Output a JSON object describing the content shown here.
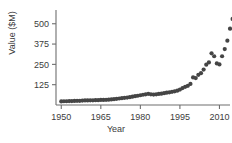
{
  "chart_data": {
    "type": "scatter",
    "title": "",
    "xlabel": "Year",
    "ylabel": "Value ($M)",
    "xlim": [
      1948,
      2014
    ],
    "ylim": [
      0,
      560
    ],
    "xticks": [
      1950,
      1965,
      1980,
      1995,
      2010
    ],
    "yticks": [
      125,
      250,
      375,
      500
    ],
    "grid": false,
    "legend": null,
    "marker": {
      "shape": "circle",
      "color": "#454545",
      "size": 2.1
    },
    "axis_color": "#6e6e6e",
    "points": [
      {
        "x": 1950,
        "y": 22
      },
      {
        "x": 1951,
        "y": 23
      },
      {
        "x": 1952,
        "y": 23
      },
      {
        "x": 1953,
        "y": 24
      },
      {
        "x": 1954,
        "y": 24
      },
      {
        "x": 1955,
        "y": 25
      },
      {
        "x": 1956,
        "y": 26
      },
      {
        "x": 1957,
        "y": 26
      },
      {
        "x": 1958,
        "y": 27
      },
      {
        "x": 1959,
        "y": 28
      },
      {
        "x": 1960,
        "y": 28
      },
      {
        "x": 1961,
        "y": 29
      },
      {
        "x": 1962,
        "y": 29
      },
      {
        "x": 1963,
        "y": 30
      },
      {
        "x": 1964,
        "y": 30
      },
      {
        "x": 1965,
        "y": 31
      },
      {
        "x": 1966,
        "y": 31
      },
      {
        "x": 1967,
        "y": 32
      },
      {
        "x": 1968,
        "y": 33
      },
      {
        "x": 1969,
        "y": 34
      },
      {
        "x": 1970,
        "y": 36
      },
      {
        "x": 1971,
        "y": 38
      },
      {
        "x": 1972,
        "y": 40
      },
      {
        "x": 1973,
        "y": 42
      },
      {
        "x": 1974,
        "y": 44
      },
      {
        "x": 1975,
        "y": 46
      },
      {
        "x": 1976,
        "y": 48
      },
      {
        "x": 1977,
        "y": 51
      },
      {
        "x": 1978,
        "y": 54
      },
      {
        "x": 1979,
        "y": 57
      },
      {
        "x": 1980,
        "y": 60
      },
      {
        "x": 1981,
        "y": 63
      },
      {
        "x": 1982,
        "y": 66
      },
      {
        "x": 1983,
        "y": 69
      },
      {
        "x": 1984,
        "y": 66
      },
      {
        "x": 1985,
        "y": 64
      },
      {
        "x": 1986,
        "y": 66
      },
      {
        "x": 1987,
        "y": 68
      },
      {
        "x": 1988,
        "y": 70
      },
      {
        "x": 1989,
        "y": 73
      },
      {
        "x": 1990,
        "y": 76
      },
      {
        "x": 1991,
        "y": 78
      },
      {
        "x": 1992,
        "y": 81
      },
      {
        "x": 1993,
        "y": 84
      },
      {
        "x": 1994,
        "y": 88
      },
      {
        "x": 1995,
        "y": 95
      },
      {
        "x": 1996,
        "y": 104
      },
      {
        "x": 1997,
        "y": 112
      },
      {
        "x": 1998,
        "y": 118
      },
      {
        "x": 1999,
        "y": 130
      },
      {
        "x": 2000,
        "y": 170
      },
      {
        "x": 2001,
        "y": 166
      },
      {
        "x": 2002,
        "y": 186
      },
      {
        "x": 2003,
        "y": 196
      },
      {
        "x": 2004,
        "y": 218
      },
      {
        "x": 2005,
        "y": 248
      },
      {
        "x": 2006,
        "y": 262
      },
      {
        "x": 2007,
        "y": 318
      },
      {
        "x": 2008,
        "y": 300
      },
      {
        "x": 2009,
        "y": 256
      },
      {
        "x": 2010,
        "y": 250
      },
      {
        "x": 2011,
        "y": 300
      },
      {
        "x": 2012,
        "y": 344
      },
      {
        "x": 2013,
        "y": 396
      },
      {
        "x": 2014,
        "y": 470
      },
      {
        "x": 2015,
        "y": 530
      }
    ]
  }
}
